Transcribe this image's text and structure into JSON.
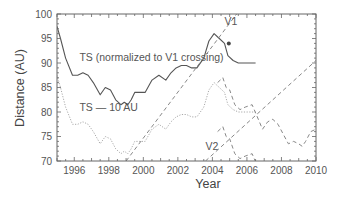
{
  "chart_data": {
    "type": "line",
    "title": "",
    "xlabel": "Year",
    "ylabel": "Distance (AU)",
    "xlim": [
      1995,
      2010
    ],
    "ylim": [
      70,
      100
    ],
    "xticks": [
      "1996",
      "1998",
      "2000",
      "2002",
      "2004",
      "2006",
      "2008",
      "2010"
    ],
    "yticks": [
      "70",
      "75",
      "80",
      "85",
      "90",
      "95",
      "100"
    ],
    "grid": false,
    "annotations": [
      {
        "text": "TS (normalized to V1 crossing)",
        "x": 1996.3,
        "y": 90.5
      },
      {
        "text": "TS — 10 AU",
        "x": 1996.3,
        "y": 80.2
      },
      {
        "text": "V1",
        "x": 2004.7,
        "y": 97.8
      },
      {
        "text": "V2",
        "x": 2003.6,
        "y": 72.3
      }
    ],
    "series": [
      {
        "name": "TS (normalized to V1 crossing)",
        "style": "solid",
        "x": [
          1995.0,
          1995.2,
          1995.5,
          1995.9,
          1996.2,
          1996.5,
          1996.8,
          1997.1,
          1997.5,
          1997.8,
          1998.1,
          1998.4,
          1998.7,
          1998.9,
          1999.1,
          1999.3,
          1999.5,
          1999.8,
          2000.1,
          2000.5,
          2000.9,
          2001.3,
          2001.6,
          2001.9,
          2002.2,
          2002.5,
          2002.8,
          2003.1,
          2003.5,
          2003.8,
          2004.1,
          2004.4,
          2004.7,
          2004.9,
          2005.2,
          2005.5,
          2005.8,
          2006.5
        ],
        "values": [
          97.5,
          95.0,
          91.0,
          87.5,
          87.5,
          88.0,
          87.5,
          86.0,
          83.5,
          85.0,
          84.5,
          82.5,
          81.5,
          82.0,
          81.5,
          82.5,
          84.0,
          84.0,
          84.0,
          86.5,
          87.5,
          86.5,
          88.0,
          89.0,
          89.5,
          89.5,
          89.0,
          89.0,
          91.0,
          94.5,
          96.0,
          95.0,
          94.0,
          91.5,
          90.5,
          90.0,
          90.0,
          90.0
        ]
      },
      {
        "name": "TS — 10 AU",
        "style": "dotted",
        "x": [
          1995.0,
          1995.2,
          1995.5,
          1995.9,
          1996.2,
          1996.5,
          1996.8,
          1997.1,
          1997.5,
          1997.8,
          1998.1,
          1998.4,
          1998.7,
          1998.9,
          1999.1,
          1999.3,
          1999.5,
          1999.8,
          2000.1,
          2000.5,
          2000.9,
          2001.3,
          2001.6,
          2001.9,
          2002.2,
          2002.5,
          2002.8,
          2003.1,
          2003.5,
          2003.8,
          2004.1,
          2004.4,
          2004.7,
          2004.9,
          2005.2,
          2005.5,
          2005.8,
          2006.5
        ],
        "values": [
          87.5,
          85.0,
          81.0,
          77.5,
          77.5,
          78.0,
          77.5,
          76.0,
          73.5,
          75.0,
          74.5,
          72.5,
          71.5,
          72.0,
          71.5,
          72.5,
          74.0,
          74.0,
          74.0,
          76.5,
          77.5,
          76.5,
          78.0,
          79.0,
          79.5,
          79.5,
          79.0,
          79.0,
          81.0,
          84.5,
          86.0,
          85.0,
          84.0,
          81.5,
          80.5,
          80.0,
          80.0,
          80.0
        ]
      },
      {
        "name": "TS upper dashed (continuation)",
        "style": "dashed",
        "x": [
          2004.3,
          2004.6,
          2004.8,
          2005.0,
          2005.3,
          2005.6,
          2005.9,
          2006.3,
          2006.6,
          2006.9,
          2007.2,
          2007.5,
          2007.8,
          2008.1,
          2008.4,
          2008.7,
          2009.0,
          2009.2,
          2009.4,
          2009.7,
          2010.0
        ],
        "values": [
          86.0,
          87.0,
          85.0,
          84.5,
          81.5,
          80.5,
          81.0,
          81.5,
          79.0,
          76.5,
          78.0,
          78.5,
          77.5,
          75.5,
          73.5,
          74.0,
          73.5,
          73.0,
          74.0,
          76.0,
          76.5
        ]
      },
      {
        "name": "TS lower dashed (continuation)",
        "style": "dashed",
        "x": [
          2004.3,
          2004.6,
          2004.8,
          2005.0,
          2005.3,
          2005.6,
          2005.9,
          2006.3,
          2006.6,
          2006.9,
          2007.2,
          2007.5,
          2007.8,
          2008.1,
          2008.4,
          2008.7,
          2009.0,
          2009.2,
          2009.4,
          2009.7,
          2010.0
        ],
        "values": [
          76.0,
          77.0,
          75.0,
          74.5,
          71.5,
          70.5,
          71.0,
          71.5,
          69.0,
          66.5,
          68.0,
          68.5,
          67.5,
          65.5,
          63.5,
          64.0,
          63.5,
          63.0,
          64.0,
          66.0,
          66.5
        ]
      },
      {
        "name": "V1",
        "style": "dashed",
        "x": [
          1999.0,
          2005.4
        ],
        "values": [
          70.0,
          100.0
        ]
      },
      {
        "name": "V2",
        "style": "dashed",
        "x": [
          2003.6,
          2010.0
        ],
        "values": [
          70.0,
          90.5
        ]
      }
    ],
    "markers": [
      {
        "name": "V1 crossing",
        "x": 2004.95,
        "y": 94.0
      }
    ]
  }
}
